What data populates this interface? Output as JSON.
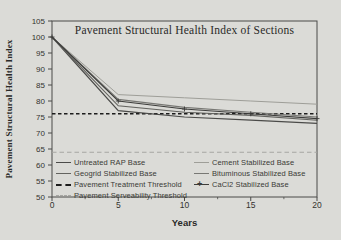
{
  "page": {
    "background": "#dbdbd7",
    "frame_color": "#4a4a48"
  },
  "chart_data": {
    "type": "line",
    "title": "Pavement Structural Health Index of Sections",
    "xlabel": "Years",
    "ylabel": "Pavement Structural Health Index",
    "xlim": [
      0,
      20
    ],
    "ylim": [
      50,
      105
    ],
    "x_ticks": [
      0,
      5,
      10,
      15,
      20
    ],
    "x_minor_ticks": [
      2.5,
      7.5,
      12.5,
      17.5
    ],
    "y_ticks": [
      50,
      55,
      60,
      65,
      70,
      75,
      80,
      85,
      90,
      95,
      100,
      105
    ],
    "grid": "off",
    "legend_position": "bottom-inside-two-columns",
    "x": [
      0,
      5,
      10,
      15,
      20
    ],
    "series": [
      {
        "id": "untreated-rap-base",
        "name": "Untreated RAP Base",
        "values": [
          100,
          77,
          75,
          74,
          73
        ],
        "color": "#4b4b49",
        "width": 1.2,
        "marker": "none"
      },
      {
        "id": "geogrid-stabilized-base",
        "name": "Geogrid Stabilized Base",
        "values": [
          100,
          78.5,
          76.5,
          75.5,
          74
        ],
        "color": "#63635f",
        "width": 1.1,
        "marker": "none"
      },
      {
        "id": "cement-stabilized-base",
        "name": "Cement Stabilized Base",
        "values": [
          100,
          82,
          81,
          80,
          79
        ],
        "color": "#9e9e98",
        "width": 1.0,
        "marker": "none"
      },
      {
        "id": "bituminous-stabilized-base",
        "name": "Bituminous Stabilized Base",
        "values": [
          100,
          80.5,
          78,
          76.5,
          75
        ],
        "color": "#787874",
        "width": 1.1,
        "marker": "none"
      },
      {
        "id": "cacl2-stabilized-base",
        "name": "CaCl2 Stabilized Base",
        "values": [
          100,
          80,
          77.5,
          76,
          74.5
        ],
        "color": "#3c3c3a",
        "width": 1.1,
        "marker": "plus"
      }
    ],
    "thresholds": [
      {
        "id": "pavement-treatment-threshold",
        "name": "Pavement Treatment Threshold",
        "value": 76,
        "color": "#1c1c1c",
        "width": 1.6,
        "dash": "3.5,2.5"
      },
      {
        "id": "pavement-serveability-threshold",
        "name": "Pavement Serveability Threshold",
        "value": 64,
        "color": "#a6a6a2",
        "width": 1.1,
        "dash": "4.5,3"
      }
    ],
    "legend": {
      "left": [
        {
          "label": "Untreated RAP Base",
          "swatch": "solid",
          "color": "#4b4b49"
        },
        {
          "label": "Geogrid Stabilized Base",
          "swatch": "solid",
          "color": "#63635f"
        },
        {
          "label": "Pavement Treatment Threshold",
          "swatch": "dashed-bold",
          "color": "#1c1c1c"
        },
        {
          "label": "Pavement Serveability Threshold",
          "swatch": "dashed",
          "color": "#a6a6a2"
        }
      ],
      "right": [
        {
          "label": "Cement Stabilized Base",
          "swatch": "solid",
          "color": "#9e9e98"
        },
        {
          "label": "Bituminous Stabilized Base",
          "swatch": "solid",
          "color": "#787874"
        },
        {
          "label": "CaCl2 Stabilized Base",
          "swatch": "solid-plus",
          "color": "#3c3c3a"
        }
      ]
    }
  }
}
